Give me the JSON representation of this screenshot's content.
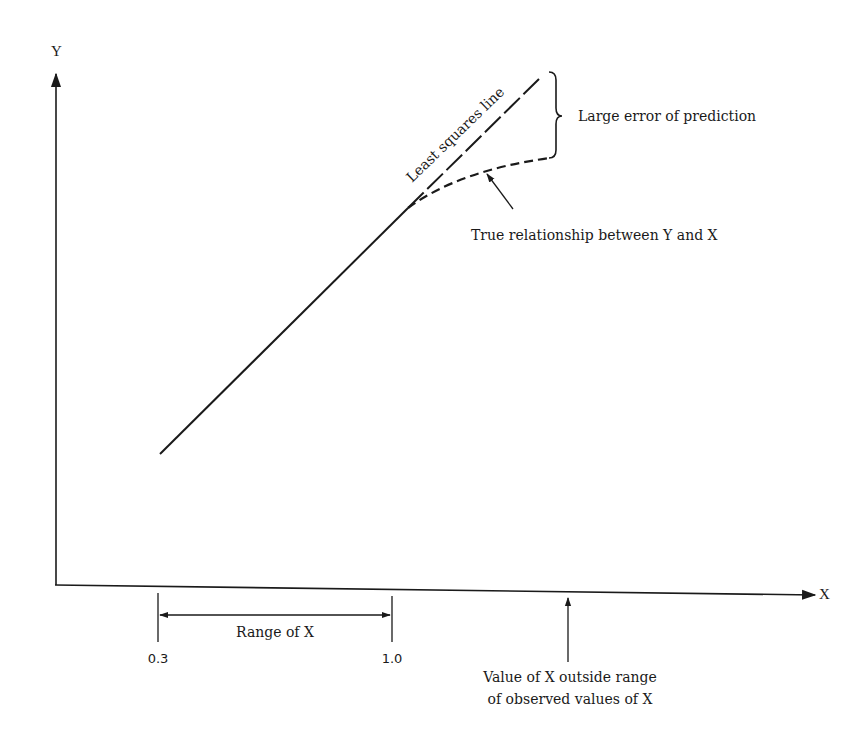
{
  "diagram": {
    "type": "extrapolation-error-illustration",
    "axes": {
      "x_label": "X",
      "y_label": "Y"
    },
    "ticks": [
      {
        "label": "0.3"
      },
      {
        "label": "1.0"
      }
    ],
    "annotations": {
      "least_squares_line": "Least squares line",
      "large_error": "Large error of prediction",
      "true_relationship": "True relationship between Y and X",
      "range_of_x": "Range of X",
      "outside_range_line1": "Value of X outside range",
      "outside_range_line2": "of observed values of X"
    },
    "colors": {
      "ink": "#1a1a1a",
      "background": "#ffffff"
    }
  }
}
